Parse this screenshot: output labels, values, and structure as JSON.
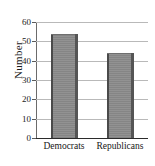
{
  "chart_data": {
    "type": "bar",
    "title": "",
    "subtitle": "",
    "xlabel": "",
    "ylabel": "Number",
    "categories": [
      "Democrats",
      "Republicans"
    ],
    "values": [
      54,
      44
    ],
    "series": [
      {
        "name": "Number",
        "values": [
          54,
          44
        ]
      }
    ],
    "ylim": [
      0,
      60
    ],
    "yticks": [
      0,
      10,
      20,
      30,
      40,
      50,
      60
    ],
    "ytick_labels": [
      "0",
      "10",
      "20",
      "30",
      "40",
      "50",
      "60"
    ],
    "grid": true,
    "grid_axis": "y",
    "legend": false,
    "legend_position": "none",
    "bar_color": "#8c8c8c",
    "grid_color": "#b9b9b9",
    "axis_color": "#2b2b2b",
    "text_color": "#1a1a1a",
    "annotations": []
  }
}
